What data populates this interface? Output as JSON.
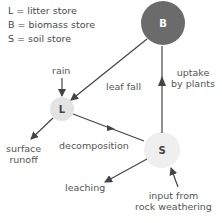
{
  "legend": [
    {
      "key": "L",
      "text": "L = litter store"
    },
    {
      "key": "B",
      "text": "B = biomass store"
    },
    {
      "key": "S",
      "text": "S = soil store"
    }
  ],
  "nodes": {
    "biomass": {
      "label": "B",
      "fill": "#6b6b6b",
      "text_color": "#ffffff"
    },
    "litter": {
      "label": "L",
      "fill": "#e6e6e6",
      "text_color": "#444444"
    },
    "soil": {
      "label": "S",
      "fill": "#efefef",
      "text_color": "#444444"
    }
  },
  "flows": {
    "rain": "rain",
    "leaf_fall": "leaf fall",
    "uptake_line1": "uptake",
    "uptake_line2": "by plants",
    "runoff_line1": "surface",
    "runoff_line2": "runoff",
    "decomposition": "decomposition",
    "leaching": "leaching",
    "weathering_line1": "input from",
    "weathering_line2": "rock weathering"
  },
  "colors": {
    "arrow": "#444444",
    "text": "#555555"
  }
}
